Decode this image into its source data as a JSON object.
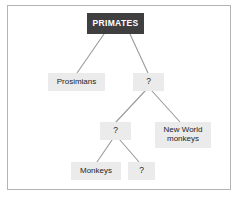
{
  "figure": {
    "kind": "cladogram",
    "frame_border_color": "#b4b4b4",
    "background_color": "#ffffff",
    "root_fill": "#3f3f3f",
    "root_text_color": "#ffffff",
    "node_fill": "#ebebeb",
    "node_text_color": "#232323",
    "connector_color": "#999999"
  },
  "nodes": {
    "primates": {
      "label": "PRIMATES"
    },
    "prosimians": {
      "label": "Prosimians"
    },
    "unknown_a": {
      "label": "?"
    },
    "unknown_b": {
      "label": "?"
    },
    "new_world_monkeys": {
      "label": "New World\nmonkeys"
    },
    "monkeys": {
      "label": "Monkeys"
    },
    "unknown_c": {
      "label": "?"
    }
  },
  "edges": [
    {
      "from": "primates",
      "to": "prosimians"
    },
    {
      "from": "primates",
      "to": "unknown_a"
    },
    {
      "from": "unknown_a",
      "to": "unknown_b"
    },
    {
      "from": "unknown_a",
      "to": "new_world_monkeys"
    },
    {
      "from": "unknown_b",
      "to": "monkeys"
    },
    {
      "from": "unknown_b",
      "to": "unknown_c"
    }
  ]
}
